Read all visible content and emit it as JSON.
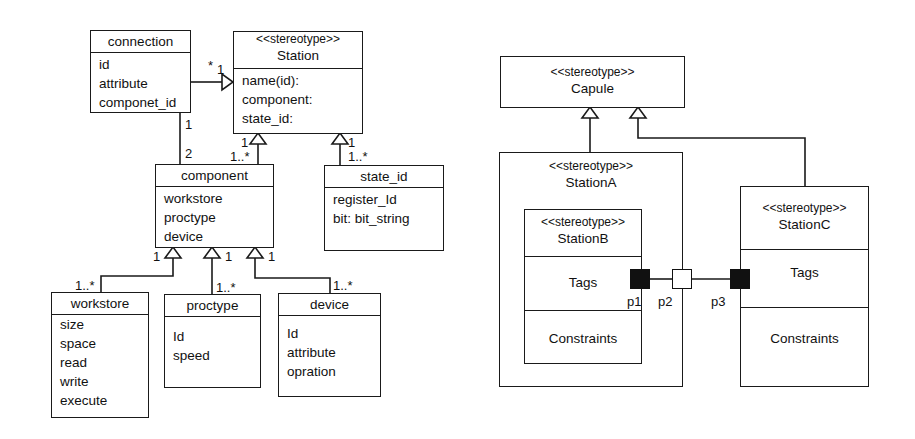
{
  "left_diagram": {
    "classes": {
      "connection": {
        "name": "connection",
        "attributes": [
          "id",
          "attribute",
          "componet_id"
        ]
      },
      "station": {
        "stereotype": "<<stereotype>>",
        "name": "Station",
        "attributes": [
          "name(id):",
          "component:",
          "state_id:"
        ]
      },
      "component": {
        "name": "component",
        "attributes": [
          "workstore",
          "proctype",
          "device"
        ]
      },
      "state_id": {
        "name": "state_id",
        "attributes": [
          "register_Id",
          "bit: bit_string"
        ]
      },
      "workstore": {
        "name": "workstore",
        "attributes": [
          "size",
          "space",
          "read",
          "write",
          "execute"
        ]
      },
      "proctype": {
        "name": "proctype",
        "attributes": [
          "Id",
          "speed"
        ]
      },
      "device": {
        "name": "device",
        "attributes": [
          "Id",
          "attribute",
          "opration"
        ]
      }
    },
    "multiplicities": {
      "connection_station_src": "*",
      "connection_station_dst": "1",
      "connection_component_top": "1",
      "connection_component_bottom": "2",
      "component_station_top": "1",
      "component_station_bottom": "1..*",
      "state_station_top": "1",
      "state_station_bottom": "1..*",
      "workstore_top": "1",
      "workstore_bottom": "1..*",
      "proctype_top": "1",
      "proctype_bottom": "1..*",
      "device_top": "1",
      "device_bottom": "1..*"
    }
  },
  "right_diagram": {
    "capule": {
      "stereotype": "<<stereotype>>",
      "name": "Capule"
    },
    "station_a": {
      "stereotype": "<<stereotype>>",
      "name": "StationA"
    },
    "station_b": {
      "stereotype": "<<stereotype>>",
      "name": "StationB",
      "tags": "Tags",
      "constraints": "Constraints"
    },
    "station_c": {
      "stereotype": "<<stereotype>>",
      "name": "StationC",
      "tags": "Tags",
      "constraints": "Constraints"
    },
    "ports": {
      "p1": "p1",
      "p2": "p2",
      "p3": "p3"
    }
  },
  "colors": {
    "line": "#1a1a1a",
    "background": "#ffffff"
  }
}
